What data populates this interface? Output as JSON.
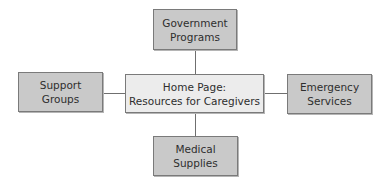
{
  "diagram": {
    "center": {
      "line1": "Home Page:",
      "line2": "Resources for Caregivers"
    },
    "top": {
      "line1": "Government",
      "line2": "Programs"
    },
    "left": {
      "line1": "Support",
      "line2": "Groups"
    },
    "right": {
      "line1": "Emergency",
      "line2": "Services"
    },
    "bottom": {
      "line1": "Medical",
      "line2": "Supplies"
    },
    "colors": {
      "outer_box_fill": "#c9c9c9",
      "center_box_fill": "#ececec",
      "border": "#7a7a7a",
      "connector": "#6f6f6f"
    }
  }
}
